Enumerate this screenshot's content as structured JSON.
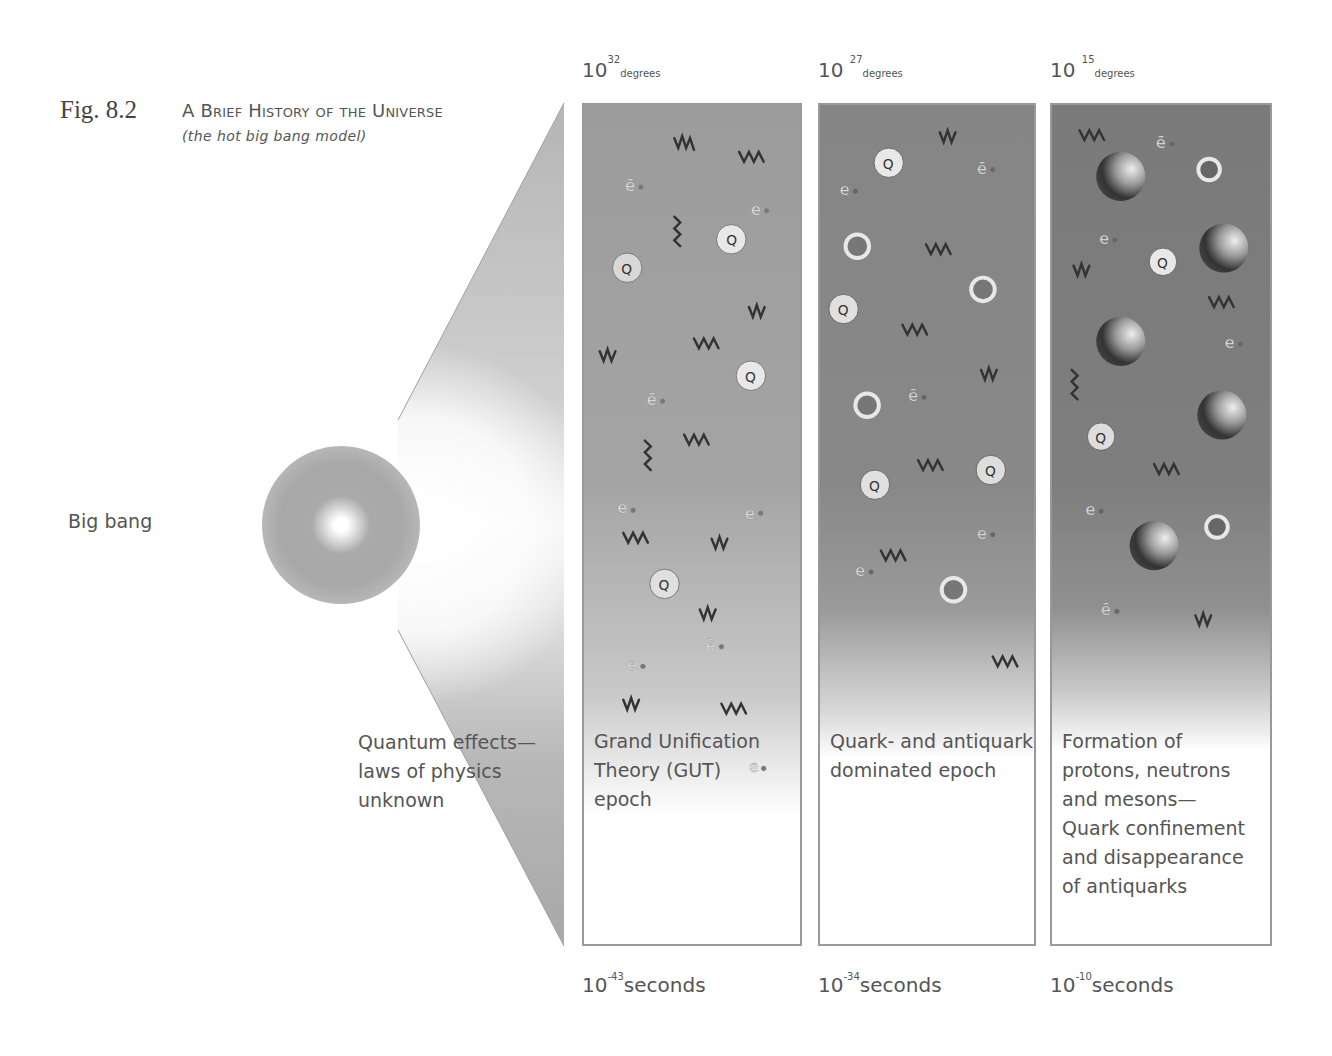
{
  "figure": {
    "number": "Fig. 8.2",
    "title": "A Brief History of the Universe",
    "subtitle": "(the hot big bang model)"
  },
  "origin": {
    "label": "Big bang",
    "quantum_label_lines": [
      "Quantum effects—",
      "laws of physics",
      "unknown"
    ]
  },
  "panels": [
    {
      "temperature": {
        "base": "10",
        "exponent": "32",
        "unit": "degrees"
      },
      "time": {
        "base": "10",
        "exponent": "-43",
        "unit": "seconds"
      },
      "label_lines": [
        "Grand Unification",
        "Theory (GUT)",
        "epoch"
      ],
      "shade_top": "#9a9a9a"
    },
    {
      "temperature": {
        "base": "10",
        "exponent": "27",
        "unit": "degrees"
      },
      "time": {
        "base": "10",
        "exponent": "-34",
        "unit": "seconds"
      },
      "label_lines": [
        "Quark- and antiquark-",
        "dominated epoch"
      ],
      "shade_top": "#858585"
    },
    {
      "temperature": {
        "base": "10",
        "exponent": "15",
        "unit": "degrees"
      },
      "time": {
        "base": "10",
        "exponent": "-10",
        "unit": "seconds"
      },
      "label_lines": [
        "Formation of",
        "protons, neutrons",
        "and mesons—",
        "Quark confinement",
        "and disappearance",
        "of antiquarks"
      ],
      "shade_top": "#7a7a7a"
    }
  ],
  "particle_glyphs": {
    "electron": "e",
    "antielectron": "ē",
    "quark": "Q",
    "antiquark": "Q̄"
  }
}
